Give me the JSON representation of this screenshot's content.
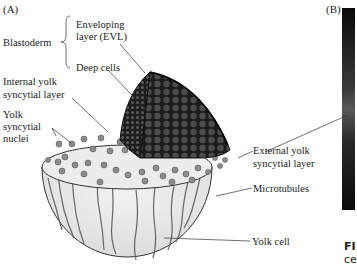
{
  "panels": {
    "a": "(A)",
    "b": "(B)"
  },
  "labels": {
    "blastoderm": "Blastoderm",
    "evl_1": "Enveloping",
    "evl_2": "layer (EVL)",
    "deep_cells": "Deep cells",
    "iysl_1": "Internal yolk",
    "iysl_2": "syncytial layer",
    "ysn_1": "Yolk",
    "ysn_2": "syncytial",
    "ysn_3": "nuclei",
    "eysl_1": "External yolk",
    "eysl_2": "syncytial layer",
    "microtubules": "Microtubules",
    "yolk_cell": "Yolk cell"
  },
  "caption": {
    "line1": "FI",
    "line2": "ce"
  },
  "colors": {
    "blastoderm_dark": "#2a2a2a",
    "yolk_fill": "#e6e6e6",
    "nuclei": "#8c8c8c",
    "photo_panel": "#111111"
  }
}
